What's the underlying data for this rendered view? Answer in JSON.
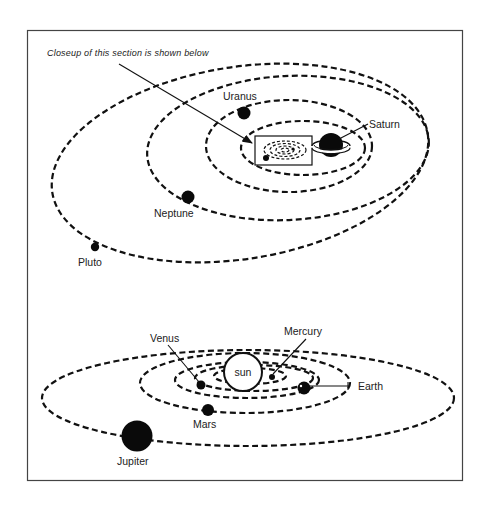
{
  "caption": "Closeup of this section is shown below",
  "outer_system": {
    "planets": [
      {
        "name": "Saturn",
        "label": "Saturn"
      },
      {
        "name": "Uranus",
        "label": "Uranus"
      },
      {
        "name": "Neptune",
        "label": "Neptune"
      },
      {
        "name": "Pluto",
        "label": "Pluto"
      }
    ]
  },
  "inner_system": {
    "sun_label": "sun",
    "planets": [
      {
        "name": "Mercury",
        "label": "Mercury"
      },
      {
        "name": "Venus",
        "label": "Venus"
      },
      {
        "name": "Earth",
        "label": "Earth"
      },
      {
        "name": "Mars",
        "label": "Mars"
      },
      {
        "name": "Jupiter",
        "label": "Jupiter"
      }
    ]
  },
  "colors": {
    "ink": "#111111",
    "background": "#ffffff"
  }
}
